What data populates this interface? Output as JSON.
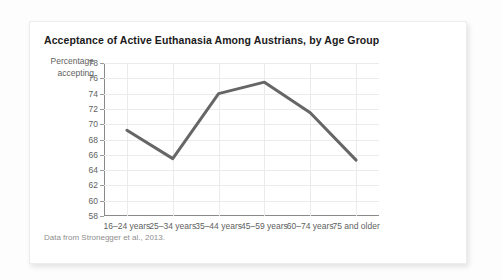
{
  "chart_data": {
    "type": "line",
    "title": "Acceptance of Active Euthanasia Among Austrians, by Age Group",
    "xlabel": "",
    "ylabel": "Percentage accepting",
    "ylabel_line1": "Percentage",
    "ylabel_line2": "accepting",
    "categories": [
      "16–24 years",
      "25–34 years",
      "35–44 years",
      "45–59 years",
      "60–74 years",
      "75 and older"
    ],
    "values": [
      69.2,
      65.5,
      74.0,
      75.5,
      71.5,
      65.3
    ],
    "ylim": [
      58,
      78
    ],
    "yticks": [
      58,
      60,
      62,
      64,
      66,
      68,
      70,
      72,
      74,
      76,
      78
    ],
    "ytick_labels": [
      "58",
      "60",
      "62",
      "64",
      "66",
      "68",
      "70",
      "72",
      "74",
      "76",
      "78"
    ],
    "grid": true,
    "grid_color": "#ebebeb",
    "legend": false,
    "line_color": "#666666",
    "line_width": 3,
    "source_note": "Data from Stronegger et al., 2013."
  },
  "card": {
    "background": "#ffffff",
    "border_color": "#ececec"
  }
}
